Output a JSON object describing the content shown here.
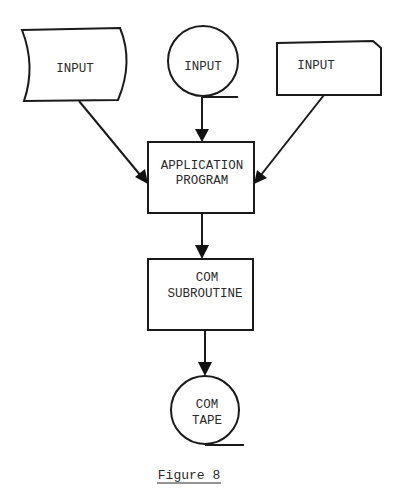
{
  "diagram": {
    "nodes": {
      "input_tape_left": {
        "label": "INPUT",
        "shape": "punched-tape"
      },
      "input_mag_tape": {
        "label": "INPUT",
        "shape": "magnetic-tape"
      },
      "input_card": {
        "label": "INPUT",
        "shape": "punched-card"
      },
      "application_program": {
        "line1": "APPLICATION",
        "line2": "PROGRAM",
        "shape": "process"
      },
      "com_subroutine": {
        "line1": "COM",
        "line2": "SUBROUTINE",
        "shape": "process"
      },
      "com_tape": {
        "line1": "COM",
        "line2": "TAPE",
        "shape": "magnetic-tape"
      }
    },
    "edges": [
      {
        "from": "input_tape_left",
        "to": "application_program"
      },
      {
        "from": "input_mag_tape",
        "to": "application_program"
      },
      {
        "from": "input_card",
        "to": "application_program"
      },
      {
        "from": "application_program",
        "to": "com_subroutine"
      },
      {
        "from": "com_subroutine",
        "to": "com_tape"
      }
    ],
    "caption": "Figure 8",
    "colors": {
      "stroke": "#1a1a1a",
      "text": "#2a2a2a",
      "background": "#ffffff"
    }
  }
}
